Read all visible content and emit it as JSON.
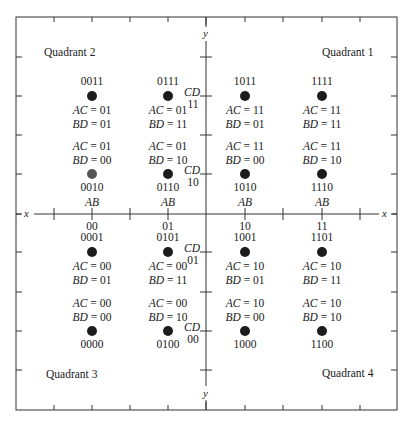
{
  "diagram": {
    "frame": {
      "left": 16,
      "top": 17,
      "right": 397,
      "bottom": 410
    },
    "axes": {
      "x_axis_y": 214,
      "y_axis_x": 206,
      "x_label": "x",
      "y_label": "y",
      "tick_x_positions": [
        54,
        92,
        130,
        168,
        206,
        245,
        283,
        322,
        360
      ],
      "tick_y_positions": [
        57,
        96,
        135,
        174,
        214,
        252,
        292,
        331,
        370
      ]
    },
    "quadrants": [
      {
        "id": "q1",
        "label": "Quadrant 1",
        "x": 322,
        "y": 46
      },
      {
        "id": "q2",
        "label": "Quadrant 2",
        "x": 44,
        "y": 46
      },
      {
        "id": "q3",
        "label": "Quadrant 3",
        "x": 46,
        "y": 368
      },
      {
        "id": "q4",
        "label": "Quadrant 4",
        "x": 322,
        "y": 367
      }
    ],
    "ab_labels": {
      "var": "AB",
      "columns": [
        {
          "x": 92,
          "value": "00"
        },
        {
          "x": 168,
          "value": "01"
        },
        {
          "x": 245,
          "value": "10"
        },
        {
          "x": 322,
          "value": "11"
        }
      ]
    },
    "cd_labels": {
      "var": "CD",
      "rows": [
        {
          "y": 96,
          "value": "11"
        },
        {
          "y": 174,
          "value": "10"
        },
        {
          "y": 252,
          "value": "01"
        },
        {
          "y": 331,
          "value": "00"
        }
      ]
    },
    "points": [
      {
        "code": "0011",
        "x": 92,
        "y": 96,
        "ac": "AC = 01",
        "bd": "BD = 01",
        "label_pos": "above"
      },
      {
        "code": "0111",
        "x": 168,
        "y": 96,
        "ac": "AC = 01",
        "bd": "BD = 11",
        "label_pos": "above"
      },
      {
        "code": "1011",
        "x": 245,
        "y": 96,
        "ac": "AC = 11",
        "bd": "BD = 01",
        "label_pos": "above"
      },
      {
        "code": "1111",
        "x": 322,
        "y": 96,
        "ac": "AC = 11",
        "bd": "BD = 11",
        "label_pos": "above"
      },
      {
        "code": "0010",
        "x": 92,
        "y": 174,
        "ac": "AC = 01",
        "bd": "BD = 00",
        "label_pos": "below",
        "color": "#555555"
      },
      {
        "code": "0110",
        "x": 168,
        "y": 174,
        "ac": "AC = 01",
        "bd": "BD = 10",
        "label_pos": "below"
      },
      {
        "code": "1010",
        "x": 245,
        "y": 174,
        "ac": "AC = 11",
        "bd": "BD = 00",
        "label_pos": "below"
      },
      {
        "code": "1110",
        "x": 322,
        "y": 174,
        "ac": "AC = 11",
        "bd": "BD = 10",
        "label_pos": "below"
      },
      {
        "code": "0001",
        "x": 92,
        "y": 252,
        "ac": "AC = 00",
        "bd": "BD = 01",
        "label_pos": "above"
      },
      {
        "code": "0101",
        "x": 168,
        "y": 252,
        "ac": "AC = 00",
        "bd": "BD = 11",
        "label_pos": "above"
      },
      {
        "code": "1001",
        "x": 245,
        "y": 252,
        "ac": "AC = 10",
        "bd": "BD = 01",
        "label_pos": "above"
      },
      {
        "code": "1101",
        "x": 322,
        "y": 252,
        "ac": "AC = 10",
        "bd": "BD = 11",
        "label_pos": "above"
      },
      {
        "code": "0000",
        "x": 92,
        "y": 331,
        "ac": "AC = 00",
        "bd": "BD = 00",
        "label_pos": "below"
      },
      {
        "code": "0100",
        "x": 168,
        "y": 331,
        "ac": "AC = 00",
        "bd": "BD = 10",
        "label_pos": "below"
      },
      {
        "code": "1000",
        "x": 245,
        "y": 331,
        "ac": "AC = 10",
        "bd": "BD = 00",
        "label_pos": "below"
      },
      {
        "code": "1100",
        "x": 322,
        "y": 331,
        "ac": "AC = 10",
        "bd": "BD = 10",
        "label_pos": "below"
      }
    ],
    "colors": {
      "line": "#333333",
      "dot": "#1c1c1c",
      "text": "#1a1a1a"
    }
  }
}
